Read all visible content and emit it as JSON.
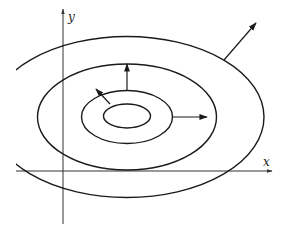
{
  "diagram": {
    "type": "contour-plot-with-gradient-arrows",
    "axes": {
      "x_label": "x",
      "y_label": "y",
      "origin": [
        63,
        171
      ],
      "x_axis": {
        "x1": 16,
        "x2": 272,
        "y": 171
      },
      "y_axis": {
        "x": 63,
        "y1": 224,
        "y2": 9
      },
      "x_label_pos": [
        263,
        166
      ],
      "y_label_pos": [
        68,
        21
      ]
    },
    "contours": [
      {
        "name": "contour-1",
        "cx": 127,
        "cy": 116,
        "rx": 23.5,
        "ry": 12
      },
      {
        "name": "contour-2",
        "cx": 127,
        "cy": 117,
        "rx": 45.5,
        "ry": 26.5
      },
      {
        "name": "contour-3",
        "cx": 127,
        "cy": 117,
        "rx": 89.5,
        "ry": 53
      },
      {
        "name": "contour-4",
        "cx": 127,
        "cy": 117,
        "rx": 137,
        "ry": 80.5
      }
    ],
    "gradient_arrows": [
      {
        "name": "arrow-up-left",
        "x1": 110,
        "y1": 104,
        "x2": 96,
        "y2": 89
      },
      {
        "name": "arrow-up",
        "x1": 127,
        "y1": 91,
        "x2": 127,
        "y2": 64
      },
      {
        "name": "arrow-right",
        "x1": 172,
        "y1": 117,
        "x2": 207,
        "y2": 117
      },
      {
        "name": "arrow-outer",
        "x1": 224,
        "y1": 60,
        "x2": 256,
        "y2": 23
      }
    ],
    "colors": {
      "line": "#1a1a1a",
      "axis": "#333333",
      "background": "#ffffff"
    }
  }
}
